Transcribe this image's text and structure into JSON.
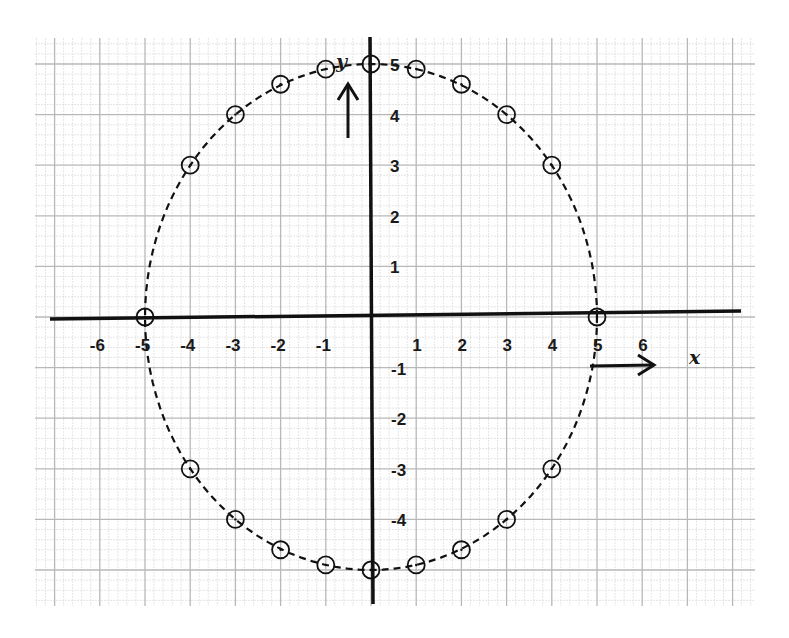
{
  "chart_data": {
    "type": "scatter",
    "title": "",
    "xlabel": "x",
    "ylabel": "y",
    "xlim": [
      -6.5,
      7.5
    ],
    "ylim": [
      -5.5,
      5.5
    ],
    "grid": true,
    "x_ticks": [
      "-6",
      "-5",
      "-4",
      "-3",
      "-2",
      "-1",
      "1",
      "2",
      "3",
      "4",
      "5",
      "6"
    ],
    "y_ticks": [
      "5",
      "4",
      "3",
      "2",
      "1",
      "-1",
      "-2",
      "-3",
      "-4"
    ],
    "series": [
      {
        "name": "circle points",
        "marker": "open-circle",
        "line": "dashed",
        "points": [
          {
            "x": -5,
            "y": 0
          },
          {
            "x": -4,
            "y": 3
          },
          {
            "x": -3,
            "y": 4
          },
          {
            "x": -2,
            "y": 4.6
          },
          {
            "x": -1,
            "y": 4.9
          },
          {
            "x": 0,
            "y": 5
          },
          {
            "x": 1,
            "y": 4.9
          },
          {
            "x": 2,
            "y": 4.6
          },
          {
            "x": 3,
            "y": 4
          },
          {
            "x": 4,
            "y": 3
          },
          {
            "x": 5,
            "y": 0
          },
          {
            "x": 4,
            "y": -3
          },
          {
            "x": 3,
            "y": -4
          },
          {
            "x": 2,
            "y": -4.6
          },
          {
            "x": 1,
            "y": -4.9
          },
          {
            "x": 0,
            "y": -5
          },
          {
            "x": -1,
            "y": -4.9
          },
          {
            "x": -2,
            "y": -4.6
          },
          {
            "x": -3,
            "y": -4
          },
          {
            "x": -4,
            "y": -3
          }
        ]
      }
    ]
  },
  "labels": {
    "x_axis": "x",
    "y_axis": "y"
  },
  "colors": {
    "ink": "#111111",
    "grid_major": "#b8b8b8",
    "grid_minor": "#dedede",
    "paper": "#ffffff"
  }
}
